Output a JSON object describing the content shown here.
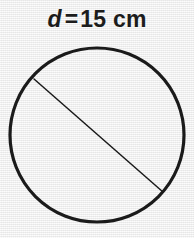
{
  "figure": {
    "kind": "geometry-diagram",
    "shape_name": "circle",
    "background_color": "#f0f0f0",
    "stroke_color": "#1a1a1a",
    "label": {
      "variable": "d",
      "equals": "=",
      "value": "15 cm",
      "full_text": "d = 15 cm"
    },
    "circle": {
      "center_x": 97,
      "center_y": 135,
      "radius": 87,
      "stroke_width": 3.2
    },
    "diameter_line": {
      "x1": 34,
      "y1": 79,
      "x2": 163,
      "y2": 192,
      "stroke_width": 1.5
    }
  }
}
